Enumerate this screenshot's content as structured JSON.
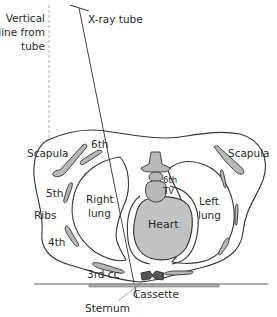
{
  "diagram": {
    "labels": {
      "vertical_line_1": "Vertical",
      "vertical_line_2": "line from",
      "vertical_line_3": "tube",
      "xray_tube": "X-ray tube",
      "scapula_right": "Scapula",
      "scapula_left": "Scapula",
      "rib_6th": "6th",
      "rib_5th": "5th",
      "ribs": "Ribs",
      "rib_4th": "4th",
      "rib_3rd_cc": "3rd cc",
      "right_lung_1": "Right",
      "right_lung_2": "lung",
      "left_lung_1": "Left",
      "left_lung_2": "lung",
      "tv_1": "6th",
      "tv_2": "TV",
      "heart": "Heart",
      "cassette": "Cassette",
      "sternum": "Sternum"
    },
    "colors": {
      "outline": "#333333",
      "fill_gray": "#b8b8b8",
      "text": "#2a2a2a",
      "dashed_line": "#999999"
    }
  }
}
